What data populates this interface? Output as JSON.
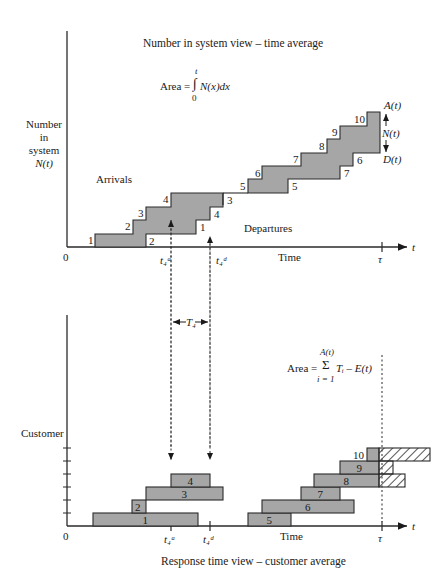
{
  "top_panel": {
    "title": "Number in system view – time average",
    "area_formula": {
      "prefix": "Area =",
      "upper": "t",
      "lower": "0",
      "integrand": "N(x)dx"
    },
    "y_label": [
      "Number",
      "in",
      "system",
      "N(t)"
    ],
    "arrivals_label": "Arrivals",
    "departures_label": "Departures",
    "origin_label": "0",
    "x_axis_label": "Time",
    "x_axis_var": "t",
    "tau_label": "τ",
    "t4a_label": "t₄ᵃ",
    "t4d_label": "t₄ᵈ",
    "A_label": "A(t)",
    "N_label": "N(t)",
    "D_label": "D(t)",
    "arrival_step_labels": [
      "1",
      "2",
      "3",
      "4",
      "5",
      "6",
      "7",
      "8",
      "9",
      "10"
    ],
    "departure_step_labels": [
      "2",
      "1",
      "4",
      "3",
      "5",
      "7",
      "6"
    ]
  },
  "middle": {
    "T4_label": "T₄"
  },
  "bottom_panel": {
    "title": "Response time view – customer average",
    "area_formula": {
      "prefix": "Area =",
      "upper": "A(t)",
      "lower": "i = 1",
      "body": "Tᵢ – E(t)"
    },
    "y_label": "Customer",
    "origin_label": "0",
    "x_axis_label": "Time",
    "x_axis_var": "t",
    "tau_label": "τ",
    "t4a_label": "t₄ᵃ",
    "t4d_label": "t₄ᵈ",
    "bars": [
      {
        "label": "1",
        "x1": 93,
        "x2": 198,
        "row": 0
      },
      {
        "label": "2",
        "x1": 132,
        "x2": 146,
        "row": 1
      },
      {
        "label": "3",
        "x1": 146,
        "x2": 223,
        "row": 2
      },
      {
        "label": "4",
        "x1": 171,
        "x2": 210,
        "row": 3
      },
      {
        "label": "5",
        "x1": 248,
        "x2": 291,
        "row": 0
      },
      {
        "label": "6",
        "x1": 262,
        "x2": 354,
        "row": 1
      },
      {
        "label": "7",
        "x1": 301,
        "x2": 340,
        "row": 2
      },
      {
        "label": "8",
        "x1": 314,
        "x2": 379,
        "row": 3
      },
      {
        "label": "9",
        "x1": 340,
        "x2": 379,
        "row": 4
      },
      {
        "label": "10",
        "x1": 367,
        "x2": 379,
        "row": 5
      }
    ],
    "hatched_bars": [
      {
        "label": "8",
        "x1": 379,
        "x2": 405,
        "row": 3
      },
      {
        "label": "9",
        "x1": 379,
        "x2": 393,
        "row": 4
      },
      {
        "label": "10",
        "x1": 379,
        "x2": 430,
        "row": 5
      }
    ]
  },
  "colors": {
    "fill": "#a6a6a6",
    "line": "#2a2a2a",
    "background": "#ffffff"
  }
}
